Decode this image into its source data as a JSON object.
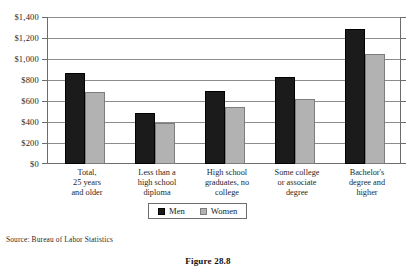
{
  "chart_data": {
    "type": "bar",
    "title": "",
    "subtitle": "",
    "xlabel": "",
    "ylabel": "",
    "ylim": [
      0,
      1400
    ],
    "ytick_step": 200,
    "grid": true,
    "legend_position": "bottom-center",
    "categories": [
      "Total,\n25 years\nand older",
      "Less than a\nhigh school\ndiploma",
      "High school\ngraduates, no\ncollege",
      "Some college\nor associate\ndegree",
      "Bachelor's\ndegree and\nhigher"
    ],
    "category_lines": [
      [
        "Total,",
        "25 years",
        "and older"
      ],
      [
        "Less than a",
        "high school",
        "diploma"
      ],
      [
        "High school",
        "graduates, no",
        "college"
      ],
      [
        "Some college",
        "or associate",
        "degree"
      ],
      [
        "Bachelor's",
        "degree and",
        "higher"
      ]
    ],
    "ytick_labels": [
      "$1,400",
      "$1,200",
      "$1,000",
      "$800",
      "$600",
      "$400",
      "$200",
      "$0"
    ],
    "ytick_values": [
      1400,
      1200,
      1000,
      800,
      600,
      400,
      200,
      0
    ],
    "series": [
      {
        "name": "Men",
        "color": "#1b1b1b",
        "values": [
          870,
          490,
          700,
          825,
          1285
        ]
      },
      {
        "name": "Women",
        "color": "#b2b2b2",
        "values": [
          685,
          390,
          545,
          620,
          1045
        ]
      }
    ],
    "source": "Source: Bureau of Labor Statistics",
    "caption": "Figure 28.8"
  },
  "legend": {
    "items": [
      {
        "label": "Men",
        "swatch": "men-swatch"
      },
      {
        "label": "Women",
        "swatch": "women-swatch"
      }
    ]
  }
}
